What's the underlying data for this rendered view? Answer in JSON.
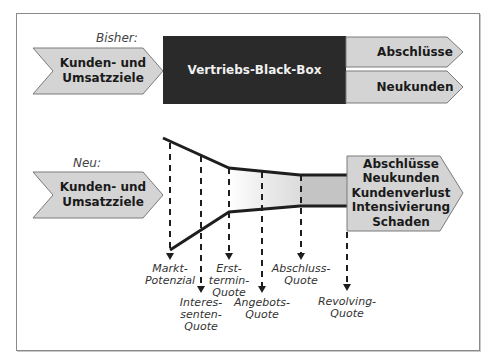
{
  "sections": {
    "before": {
      "label": "Bisher:",
      "input": "Kunden- und\nUmsatzziele",
      "process": "Vertriebs-Black-Box",
      "outputs": [
        "Abschlüsse",
        "Neukunden"
      ]
    },
    "after": {
      "label": "Neu:",
      "input": "Kunden- und\nUmsatzziele",
      "outputs": [
        "Abschlüsse",
        "Neukunden",
        "Kundenverlust",
        "Intensivierung",
        "Schaden"
      ],
      "funnel_stages": [
        {
          "label": "Markt-\nPotenzial",
          "x": 170,
          "arrow_y": 258
        },
        {
          "label": "Interes-\nsenten-\nQuote",
          "x": 201,
          "arrow_y": 291
        },
        {
          "label": "Erst-\ntermin-\nQuote",
          "x": 229,
          "arrow_y": 258
        },
        {
          "label": "Angebots-\nQuote",
          "x": 262,
          "arrow_y": 291
        },
        {
          "label": "Abschluss-\nQuote",
          "x": 301,
          "arrow_y": 258
        },
        {
          "label": "Revolving-\nQuote",
          "x": 347,
          "arrow_y": 289
        }
      ]
    }
  },
  "colors": {
    "shape_fill": "#d4d4d4",
    "shape_stroke": "#7a7a7a",
    "black_box": "#2a2a2a",
    "line": "#1e1e1e"
  }
}
